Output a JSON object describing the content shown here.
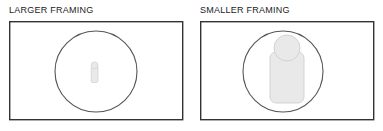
{
  "figure": {
    "background_color": "#ffffff",
    "panel_count": 2,
    "panels": [
      {
        "id": "larger-framing",
        "label": "LARGER FRAMING",
        "frame": {
          "x": 9,
          "y": 21,
          "width": 174,
          "height": 99,
          "stroke": "#333333",
          "stroke_width": 1.4,
          "fill": "#ffffff"
        },
        "ellipse": {
          "cx": 96,
          "cy": 71.5,
          "rx": 41,
          "ry": 40.5,
          "stroke": "#555555",
          "stroke_width": 1.1,
          "fill": "none"
        },
        "figure_icon": {
          "name": "person-silhouette",
          "size_label": "small",
          "head": {
            "cx": 94.6,
            "cy": 65.5,
            "r": 3.4
          },
          "body": {
            "x": 91.2,
            "y": 66.5,
            "width": 6.8,
            "height": 16,
            "corner_radius": 1.6
          },
          "fill": "#e9e9e9",
          "stroke": "#cfcfcf",
          "stroke_width": 0.7
        }
      },
      {
        "id": "smaller-framing",
        "label": "SMALLER FRAMING",
        "frame": {
          "x": 9,
          "y": 21,
          "width": 174,
          "height": 99,
          "stroke": "#333333",
          "stroke_width": 1.4,
          "fill": "#ffffff"
        },
        "ellipse": {
          "cx": 92,
          "cy": 71.5,
          "rx": 40,
          "ry": 40.5,
          "stroke": "#555555",
          "stroke_width": 1.1,
          "fill": "none"
        },
        "figure_icon": {
          "name": "person-silhouette",
          "size_label": "large",
          "head": {
            "cx": 96,
            "cy": 48,
            "r": 13
          },
          "body": {
            "x": 79,
            "y": 52,
            "width": 34,
            "height": 51,
            "corner_radius": 6
          },
          "fill": "#e9e9e9",
          "stroke": "#cfcfcf",
          "stroke_width": 0.9
        }
      }
    ]
  },
  "colors": {
    "label_text": "#1c1c1c",
    "frame_stroke": "#333333",
    "ellipse_stroke": "#555555",
    "figure_fill": "#e9e9e9",
    "figure_stroke": "#cfcfcf"
  }
}
